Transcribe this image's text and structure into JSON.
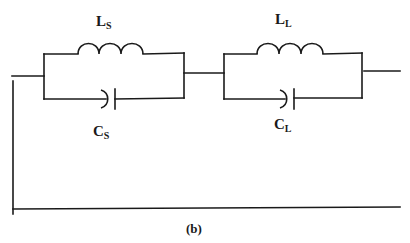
{
  "figure": {
    "caption": "(b)"
  },
  "components": {
    "source_tank": {
      "inductor": {
        "symbol": "L",
        "subscript": "S"
      },
      "capacitor": {
        "symbol": "C",
        "subscript": "S"
      }
    },
    "load_tank": {
      "inductor": {
        "symbol": "L",
        "subscript": "L"
      },
      "capacitor": {
        "symbol": "C",
        "subscript": "L"
      }
    }
  },
  "colors": {
    "line": "#1a1a1a",
    "background": "#ffffff"
  }
}
